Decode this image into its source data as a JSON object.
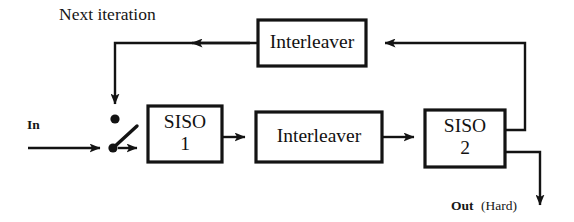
{
  "diagram": {
    "background_color": "#ffffff",
    "ink_color": "#131313",
    "blocks": [
      {
        "id": "interleaver_top",
        "label": "Interleaver",
        "name": "block-interleaver-top",
        "x": 258,
        "y": 20,
        "w": 108,
        "h": 46
      },
      {
        "id": "siso_1",
        "label_line1": "SISO",
        "label_line2": "1",
        "name": "block-siso-1",
        "x": 148,
        "y": 106,
        "w": 74,
        "h": 56
      },
      {
        "id": "interleaver_mid",
        "label": "Interleaver",
        "name": "block-interleaver-middle",
        "x": 256,
        "y": 112,
        "w": 126,
        "h": 50
      },
      {
        "id": "siso_2",
        "label_line1": "SISO",
        "label_line2": "2",
        "name": "block-siso-2",
        "x": 425,
        "y": 110,
        "w": 80,
        "h": 57
      }
    ],
    "labels": {
      "next_iteration": "Next iteration",
      "input": "In",
      "output_bold": "Out",
      "output_regular": "(Hard)"
    },
    "switch": {
      "name": "input-switch",
      "pivot_x": 113,
      "pivot_y": 148,
      "upper_contact_x": 115,
      "upper_contact_y": 119,
      "lever_end_x": 136,
      "lever_end_y": 127
    },
    "signal_flow": [
      "In -> switch",
      "switch -> SISO 1",
      "SISO 1 -> Interleaver (middle)",
      "Interleaver (middle) -> SISO 2",
      "SISO 2 -> Interleaver (top) -> Next iteration -> switch",
      "SISO 2 -> Out (Hard)"
    ]
  }
}
